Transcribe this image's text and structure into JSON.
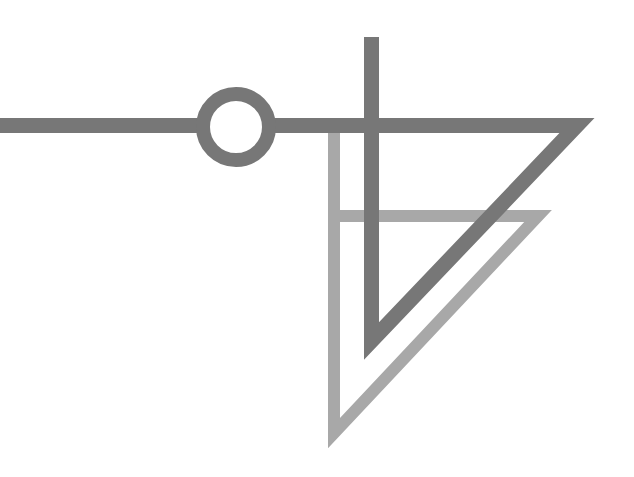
{
  "diagram": {
    "title": "",
    "colors": {
      "background": "#ffffff",
      "dark_stroke": "#777777",
      "light_stroke": "#a8a8a8"
    },
    "elements": [
      {
        "name": "horizontal-line",
        "type": "line"
      },
      {
        "name": "ring-node",
        "type": "circle"
      },
      {
        "name": "vertical-line",
        "type": "line"
      },
      {
        "name": "dark-triangle",
        "type": "triangle"
      },
      {
        "name": "light-triangle",
        "type": "triangle"
      }
    ]
  }
}
